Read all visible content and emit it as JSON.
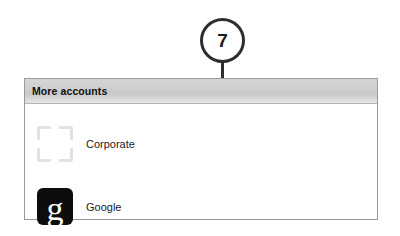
{
  "callout": {
    "number": "7",
    "line_icon": "leader-line"
  },
  "panel": {
    "header": {
      "title": "More accounts"
    },
    "accounts": [
      {
        "label": "Corporate",
        "icon": "corporate-brackets-icon",
        "icon_color": "#e2e2e2"
      },
      {
        "label": "Google",
        "icon": "google-g-icon",
        "icon_glyph": "g",
        "icon_color": "#0d0d0d"
      }
    ]
  }
}
